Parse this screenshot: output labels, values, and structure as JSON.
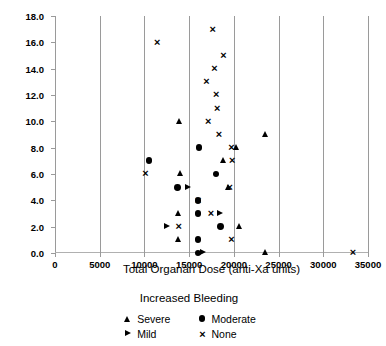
{
  "figure": {
    "clipped_title": "",
    "ylabel": "Patient Number",
    "ylabel_superscript": "*",
    "xlabel": "Total Organan Dose (anti-Xa units)"
  },
  "legend": {
    "title": "Increased Bleeding",
    "items": [
      {
        "label": "Severe",
        "marker": "triangle-up",
        "key": "severe"
      },
      {
        "label": "Moderate",
        "marker": "circle-filled",
        "key": "moderate"
      },
      {
        "label": "Mild",
        "marker": "triangle-right",
        "key": "mild"
      },
      {
        "label": "None",
        "marker": "x-cross",
        "key": "none"
      }
    ]
  },
  "chart_data": {
    "type": "scatter",
    "title": "",
    "xlabel": "Total Organan Dose (anti-Xa units)",
    "ylabel": "Patient Number*",
    "xlim": [
      0,
      35000
    ],
    "ylim": [
      0,
      18
    ],
    "xticks": [
      0,
      5000,
      10000,
      15000,
      20000,
      25000,
      30000,
      35000
    ],
    "xtick_labels": [
      "0",
      "5000",
      "10000",
      "15000",
      "20000",
      "25000",
      "30000",
      "35000"
    ],
    "yticks": [
      0,
      2,
      4,
      6,
      8,
      10,
      12,
      14,
      16,
      18
    ],
    "ytick_labels": [
      "0.0",
      "2.0",
      "4.0",
      "6.0",
      "8.0",
      "10.0",
      "12.0",
      "14.0",
      "16.0",
      "18.0"
    ],
    "grid": {
      "vertical": true,
      "horizontal": false
    },
    "legend_position": "below-center",
    "legend_title": "Increased Bleeding",
    "series": [
      {
        "name": "Severe",
        "marker": "triangle-up",
        "points": [
          {
            "x": 13900,
            "y": 10
          },
          {
            "x": 23500,
            "y": 9
          },
          {
            "x": 20300,
            "y": 8
          },
          {
            "x": 18800,
            "y": 7
          },
          {
            "x": 14000,
            "y": 6
          },
          {
            "x": 19400,
            "y": 5
          },
          {
            "x": 13800,
            "y": 3
          },
          {
            "x": 20600,
            "y": 2
          },
          {
            "x": 13800,
            "y": 1
          },
          {
            "x": 23500,
            "y": 0
          }
        ]
      },
      {
        "name": "Moderate",
        "marker": "circle-filled",
        "points": [
          {
            "x": 16100,
            "y": 8
          },
          {
            "x": 10500,
            "y": 7
          },
          {
            "x": 18000,
            "y": 6
          },
          {
            "x": 13700,
            "y": 5
          },
          {
            "x": 16000,
            "y": 4
          },
          {
            "x": 16000,
            "y": 3
          },
          {
            "x": 18500,
            "y": 2
          },
          {
            "x": 16000,
            "y": 1
          },
          {
            "x": 16000,
            "y": 0
          }
        ]
      },
      {
        "name": "Mild",
        "marker": "triangle-right",
        "points": [
          {
            "x": 14900,
            "y": 5
          },
          {
            "x": 18500,
            "y": 3
          },
          {
            "x": 12600,
            "y": 2
          },
          {
            "x": 16600,
            "y": 0
          }
        ]
      },
      {
        "name": "None",
        "marker": "x-cross",
        "points": [
          {
            "x": 17600,
            "y": 17
          },
          {
            "x": 11400,
            "y": 16
          },
          {
            "x": 18800,
            "y": 15
          },
          {
            "x": 17800,
            "y": 14
          },
          {
            "x": 16900,
            "y": 13
          },
          {
            "x": 18000,
            "y": 12
          },
          {
            "x": 18100,
            "y": 11
          },
          {
            "x": 17100,
            "y": 10
          },
          {
            "x": 18300,
            "y": 9
          },
          {
            "x": 19700,
            "y": 8
          },
          {
            "x": 19800,
            "y": 7
          },
          {
            "x": 10100,
            "y": 6
          },
          {
            "x": 19500,
            "y": 5
          },
          {
            "x": 16000,
            "y": 4
          },
          {
            "x": 17400,
            "y": 3
          },
          {
            "x": 13800,
            "y": 2
          },
          {
            "x": 19700,
            "y": 1
          },
          {
            "x": 33300,
            "y": 0
          }
        ]
      }
    ]
  }
}
